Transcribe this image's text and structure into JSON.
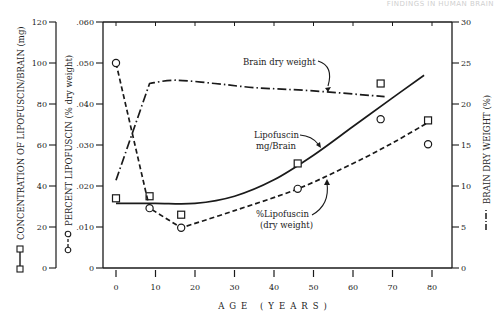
{
  "header": {
    "faint_text": "FINDINGS IN HUMAN BRAIN"
  },
  "chart_data": {
    "type": "line",
    "title": "",
    "xlabel": "AGE (YEARS)",
    "xlim": [
      0,
      80
    ],
    "x_ticks": [
      0,
      10,
      20,
      30,
      40,
      50,
      60,
      70,
      80
    ],
    "x_tick_labels": [
      "0",
      "10",
      "20",
      "30",
      "40",
      "50",
      "60",
      "70",
      "80"
    ],
    "grid": false,
    "axes": {
      "left_outer": {
        "label": "CONCENTRATION OF LIPOFUSCIN/BRAIN (mg)",
        "legend_marker": "square-solid-line",
        "ylim": [
          0,
          120
        ],
        "ticks": [
          0,
          20,
          40,
          60,
          80,
          100,
          120
        ],
        "tick_labels": [
          "0",
          "20",
          "40",
          "60",
          "80",
          "100",
          "120"
        ]
      },
      "left_inner": {
        "label": "PERCENT LIPOFUSCIN (% dry weight)",
        "legend_marker": "circle-dashed-line",
        "ylim": [
          0,
          0.06
        ],
        "ticks": [
          0,
          0.01,
          0.02,
          0.03,
          0.04,
          0.05,
          0.06
        ],
        "tick_labels": [
          "0",
          ".010",
          ".020",
          ".030",
          ".040",
          ".050",
          ".060"
        ]
      },
      "right": {
        "label": "BRAIN DRY WEIGHT (%)",
        "legend_marker": "dash-dot-line",
        "ylim": [
          0,
          30
        ],
        "ticks": [
          0,
          5,
          10,
          15,
          20,
          25,
          30
        ],
        "tick_labels": [
          "0",
          "5",
          "10",
          "15",
          "20",
          "25",
          "30"
        ]
      }
    },
    "series": [
      {
        "name": "Lipofuscin mg/Brain",
        "axis": "left_outer",
        "marker": "square",
        "points": [
          {
            "x": 0,
            "y": 34
          },
          {
            "x": 8.5,
            "y": 35
          },
          {
            "x": 16.5,
            "y": 26
          },
          {
            "x": 46,
            "y": 51
          },
          {
            "x": 67,
            "y": 90
          },
          {
            "x": 79,
            "y": 72
          }
        ],
        "curve": [
          {
            "x": 0,
            "y": 31.5
          },
          {
            "x": 10,
            "y": 31.5
          },
          {
            "x": 20,
            "y": 31.5
          },
          {
            "x": 30,
            "y": 35
          },
          {
            "x": 40,
            "y": 43
          },
          {
            "x": 50,
            "y": 55
          },
          {
            "x": 60,
            "y": 69
          },
          {
            "x": 70,
            "y": 83
          },
          {
            "x": 78,
            "y": 94
          }
        ],
        "line_style": "solid"
      },
      {
        "name": "%Lipofuscin (dry weight)",
        "axis": "left_inner",
        "marker": "circle",
        "points": [
          {
            "x": 0,
            "y": 0.05
          },
          {
            "x": 8.5,
            "y": 0.0146
          },
          {
            "x": 16.5,
            "y": 0.0098
          },
          {
            "x": 46,
            "y": 0.0193
          },
          {
            "x": 67,
            "y": 0.0363
          },
          {
            "x": 79,
            "y": 0.0302
          }
        ],
        "curve": [
          {
            "x": 0,
            "y": 0.05
          },
          {
            "x": 8.5,
            "y": 0.0146
          },
          {
            "x": 16.5,
            "y": 0.0098
          },
          {
            "x": 30,
            "y": 0.014
          },
          {
            "x": 46,
            "y": 0.0193
          },
          {
            "x": 60,
            "y": 0.0255
          },
          {
            "x": 70,
            "y": 0.0305
          },
          {
            "x": 79,
            "y": 0.0355
          }
        ],
        "line_style": "dashed"
      },
      {
        "name": "Brain dry weight",
        "axis": "right",
        "marker": "none",
        "curve": [
          {
            "x": 0,
            "y": 10.7
          },
          {
            "x": 8.5,
            "y": 22.5
          },
          {
            "x": 15,
            "y": 22.9
          },
          {
            "x": 25,
            "y": 22.5
          },
          {
            "x": 35,
            "y": 22.0
          },
          {
            "x": 50,
            "y": 21.6
          },
          {
            "x": 68,
            "y": 20.9
          }
        ],
        "line_style": "dash-dot"
      }
    ],
    "annotations": [
      {
        "text": "Brain dry weight",
        "points_to": "Brain dry weight"
      },
      {
        "text_lines": [
          "Lipofuscin",
          "mg/Brain"
        ],
        "points_to": "Lipofuscin mg/Brain"
      },
      {
        "text_lines": [
          "%Lipofuscin",
          "(dry weight)"
        ],
        "points_to": "%Lipofuscin (dry weight)"
      }
    ]
  }
}
